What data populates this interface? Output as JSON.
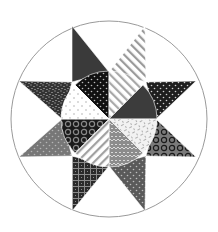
{
  "canvas": {
    "width": 218,
    "height": 232,
    "background": "#ffffff"
  },
  "outer_circle": {
    "cx": 109,
    "cy": 119,
    "r": 98,
    "stroke": "#9a9a9a",
    "fill": "#ffffff"
  },
  "inner_circle": {
    "cx": 109,
    "cy": 119,
    "r": 48
  },
  "star_points": [
    {
      "name": "star-point-top-left",
      "points": [
        [
          72,
          26
        ],
        [
          72,
          82
        ],
        [
          109,
          72
        ]
      ],
      "pattern": "solid",
      "base": "#3a3a3a",
      "fg": "#3a3a3a"
    },
    {
      "name": "star-point-top-right",
      "points": [
        [
          145,
          26
        ],
        [
          109,
          72
        ],
        [
          146,
          82
        ]
      ],
      "pattern": "diag-lines",
      "base": "#ffffff",
      "fg": "#9a9a9a"
    },
    {
      "name": "star-point-right-upper",
      "points": [
        [
          196,
          81
        ],
        [
          146,
          82
        ],
        [
          156,
          119
        ]
      ],
      "pattern": "dots",
      "base": "#1e1e1e",
      "fg": "#cfcfcf"
    },
    {
      "name": "star-point-right-lower",
      "points": [
        [
          196,
          157
        ],
        [
          156,
          119
        ],
        [
          146,
          156
        ]
      ],
      "pattern": "rings",
      "base": "#7a7a7a",
      "fg": "#1a1a1a"
    },
    {
      "name": "star-point-bottom-right",
      "points": [
        [
          145,
          211
        ],
        [
          146,
          156
        ],
        [
          109,
          166
        ]
      ],
      "pattern": "dots",
      "base": "#5a5a5a",
      "fg": "#bdbdbd"
    },
    {
      "name": "star-point-bottom-left",
      "points": [
        [
          72,
          211
        ],
        [
          109,
          166
        ],
        [
          72,
          156
        ]
      ],
      "pattern": "grid",
      "base": "#2a2a2a",
      "fg": "#8a8a8a"
    },
    {
      "name": "star-point-left-lower",
      "points": [
        [
          19,
          157
        ],
        [
          72,
          156
        ],
        [
          62,
          119
        ]
      ],
      "pattern": "dots",
      "base": "#777777",
      "fg": "#b5b5b5"
    },
    {
      "name": "star-point-left-upper",
      "points": [
        [
          19,
          81
        ],
        [
          72,
          82
        ],
        [
          62,
          119
        ]
      ],
      "pattern": "speckle",
      "base": "#333333",
      "fg": "#c8c8c8"
    }
  ],
  "wedges": [
    {
      "name": "wedge-top-left",
      "start_deg": 225,
      "end_deg": 270,
      "pattern": "dots",
      "base": "#111111",
      "fg": "#bbbbbb"
    },
    {
      "name": "wedge-top-right",
      "start_deg": 270,
      "end_deg": 315,
      "pattern": "diag-lines",
      "base": "#ffffff",
      "fg": "#a8a8a8"
    },
    {
      "name": "wedge-right-upper",
      "start_deg": 315,
      "end_deg": 360,
      "pattern": "solid",
      "base": "#3c3c3c",
      "fg": "#3c3c3c"
    },
    {
      "name": "wedge-right-lower",
      "start_deg": 0,
      "end_deg": 45,
      "pattern": "weave",
      "base": "#f2f2f2",
      "fg": "#b0b0b0"
    },
    {
      "name": "wedge-bottom-right",
      "start_deg": 45,
      "end_deg": 90,
      "pattern": "zigzag",
      "base": "#8c8c8c",
      "fg": "#d8d8d8"
    },
    {
      "name": "wedge-bottom-left",
      "start_deg": 90,
      "end_deg": 135,
      "pattern": "diag-lines2",
      "base": "#ffffff",
      "fg": "#a0a0a0"
    },
    {
      "name": "wedge-left-lower",
      "start_deg": 135,
      "end_deg": 180,
      "pattern": "rings",
      "base": "#1a1a1a",
      "fg": "#8a8a8a"
    },
    {
      "name": "wedge-left-upper",
      "start_deg": 180,
      "end_deg": 225,
      "pattern": "sparse-dots",
      "base": "#ffffff",
      "fg": "#a0a0a0"
    }
  ],
  "outline_color": "#ffffff"
}
